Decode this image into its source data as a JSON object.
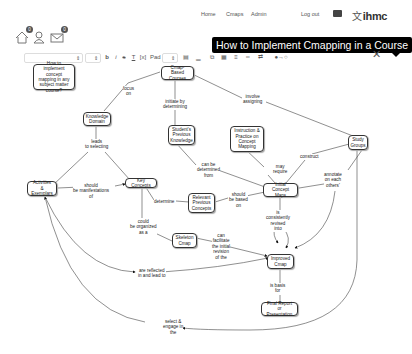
{
  "topnav": {
    "links": [
      "Home",
      "Cmaps",
      "Admin"
    ],
    "logout": "Log out",
    "logo": "ihmc",
    "logo_mark": "⽂"
  },
  "user_icons": [
    {
      "name": "home-icon",
      "badge": "0"
    },
    {
      "name": "user-icon",
      "badge": ""
    },
    {
      "name": "mail-icon",
      "badge": "0"
    }
  ],
  "title": "How to Implement Cmapping in a Course",
  "toolbar": {
    "font_family": "",
    "font_size": "",
    "bold": "b",
    "italic": "i",
    "strike": "s",
    "underline": "T",
    "case": "[x]",
    "pad_label": "Pad",
    "pad_value": ""
  },
  "concept_map": {
    "nodes": [
      {
        "id": "question",
        "text": "How to implement concept mapping in any subject matter course?"
      },
      {
        "id": "cmap_courses",
        "text": "Cmap-Based Courses"
      },
      {
        "id": "knowledge_domain",
        "text": "Knowledge Domain"
      },
      {
        "id": "student_knowledge",
        "text": "Student's Previous Knowledge"
      },
      {
        "id": "instruction",
        "text": "Instruction & Practice on Concept Mapping"
      },
      {
        "id": "study_groups",
        "text": "Study Groups"
      },
      {
        "id": "activities",
        "text": "Activities & Exemplars"
      },
      {
        "id": "key_concepts",
        "text": "Key Concepts"
      },
      {
        "id": "initial_maps",
        "text": "Initial Concept Maps"
      },
      {
        "id": "relevant_concepts",
        "text": "Relevant Previous Concepts"
      },
      {
        "id": "skeleton",
        "text": "Skeleton Cmap"
      },
      {
        "id": "improved",
        "text": "Improved Cmap"
      },
      {
        "id": "final",
        "text": "Final Report or Presentation"
      }
    ],
    "linking_phrases": [
      {
        "id": "focus_on",
        "text": "focus\non"
      },
      {
        "id": "initiate",
        "text": "initiate by\ndetermining"
      },
      {
        "id": "involve",
        "text": "involve\nassigning"
      },
      {
        "id": "leads",
        "text": "leads\nto selecting"
      },
      {
        "id": "can_be_determined",
        "text": "can be\ndetermined\nfrom"
      },
      {
        "id": "may_require",
        "text": "may\nrequire"
      },
      {
        "id": "construct",
        "text": "construct"
      },
      {
        "id": "annotate",
        "text": "annotate\non each\nothers'"
      },
      {
        "id": "manifestations",
        "text": "should\nbe manifestations\nof"
      },
      {
        "id": "determine",
        "text": "determine"
      },
      {
        "id": "based_on",
        "text": "should\nbe based\non"
      },
      {
        "id": "revised",
        "text": "is\nconsistently\nrevised\ninto"
      },
      {
        "id": "organized",
        "text": "could\nbe organized\nas a"
      },
      {
        "id": "facilitate",
        "text": "can\nfacilitate\nthe initial\nrevision\nof the"
      },
      {
        "id": "reflected",
        "text": "are reflected\nin and lead to"
      },
      {
        "id": "basis",
        "text": "is basis\nfor"
      },
      {
        "id": "select_engage",
        "text": "select &\nengage in\nthe"
      }
    ]
  }
}
